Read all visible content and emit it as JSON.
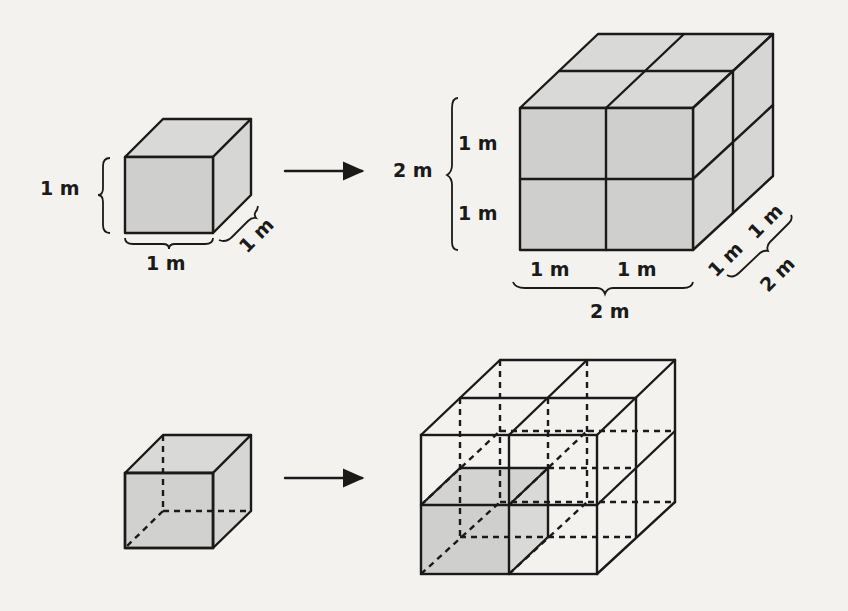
{
  "figure": {
    "top_row": {
      "unit_cube": {
        "height_label": "1 m",
        "width_label": "1 m",
        "depth_label": "1 m"
      },
      "scaled_cube": {
        "total_height_label": "2 m",
        "height_part_labels": [
          "1 m",
          "1 m"
        ],
        "width_part_labels": [
          "1 m",
          "1 m"
        ],
        "total_width_label": "2 m",
        "depth_part_labels": [
          "1 m",
          "1 m"
        ],
        "total_depth_label": "2 m"
      }
    },
    "bottom_row": {
      "unit_cube_description": "Solid cube with hidden edges dashed",
      "scaled_cube_description": "2×2×2 wireframe made of 8 unit cubes, one cube shaded"
    },
    "arrow_icon": "right-arrow",
    "colors": {
      "background": "#f3f2ef",
      "cube_fill": "#cfcfcd",
      "stroke": "#1a1a1a"
    }
  }
}
